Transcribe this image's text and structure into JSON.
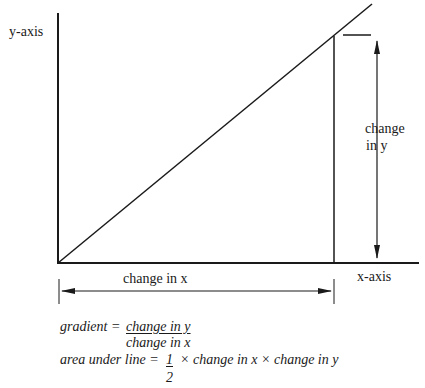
{
  "labels": {
    "y_axis": "y-axis",
    "x_axis": "x-axis",
    "change_in_y_line1": "change",
    "change_in_y_line2": "in  y",
    "change_in_x": "change in x"
  },
  "formulas": {
    "gradient": {
      "lhs": "gradient =",
      "numerator": "change in y",
      "denominator": "change in x"
    },
    "area": {
      "lhs": "area under line =",
      "fraction_numerator": "1",
      "fraction_denominator": "2",
      "rhs": "× change in x × change in y"
    }
  },
  "geometry": {
    "origin": [
      58,
      263
    ],
    "y_axis_top": [
      58,
      13
    ],
    "x_axis_end": [
      418,
      263
    ],
    "line_end": [
      372,
      4
    ],
    "drop_point": [
      334,
      36
    ],
    "stroke_color": "#1a1a1a",
    "background": "#ffffff"
  }
}
